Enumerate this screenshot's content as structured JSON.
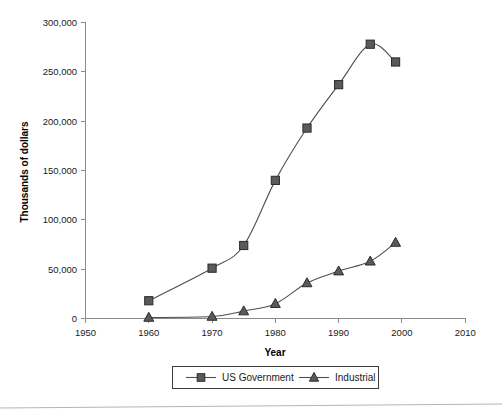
{
  "chart_data": {
    "type": "line",
    "title": "",
    "xlabel": "Year",
    "ylabel": "Thousands of dollars",
    "xlim": [
      1950,
      2010
    ],
    "ylim": [
      0,
      300000
    ],
    "xticks": [
      1950,
      1960,
      1970,
      1980,
      1990,
      2000,
      2010
    ],
    "xtick_labels": [
      "1950",
      "1960",
      "1970",
      "1980",
      "1990",
      "2000",
      "2010"
    ],
    "yticks": [
      0,
      50000,
      100000,
      150000,
      200000,
      250000,
      300000
    ],
    "ytick_labels": [
      "0",
      "50,000",
      "100,000",
      "150,000",
      "200,000",
      "250,000",
      "300,000"
    ],
    "grid": false,
    "legend_position": "bottom",
    "series": [
      {
        "name": "US Government",
        "marker": "square",
        "color": "#5a5a5a",
        "x": [
          1960,
          1970,
          1975,
          1980,
          1985,
          1990,
          1995,
          1999
        ],
        "values": [
          18000,
          51000,
          74000,
          140000,
          193000,
          237000,
          278000,
          260000
        ]
      },
      {
        "name": "Industrial",
        "marker": "triangle",
        "color": "#5a5a5a",
        "x": [
          1960,
          1970,
          1975,
          1980,
          1985,
          1990,
          1995,
          1999
        ],
        "values": [
          1000,
          2000,
          7500,
          15000,
          36000,
          48000,
          58000,
          77000
        ]
      }
    ]
  },
  "axes": {
    "y_title": "Thousands of dollars",
    "x_title": "Year",
    "y_tick_labels": [
      "300,000",
      "250,000",
      "200,000",
      "150,000",
      "100,000",
      "50,000",
      "0"
    ],
    "x_tick_labels": [
      "1950",
      "1960",
      "1970",
      "1980",
      "1990",
      "2000",
      "2010"
    ]
  },
  "legend": {
    "entries": [
      {
        "label": "US Government",
        "marker": "square"
      },
      {
        "label": "Industrial",
        "marker": "triangle"
      }
    ]
  },
  "colors": {
    "series_line": "#4f4f4f",
    "marker_fill": "#5a5a5a",
    "marker_stroke": "#2b2b2b",
    "axis": "#8a8a8a",
    "text": "#1a1a1a",
    "legend_border": "#3c3c3c"
  }
}
